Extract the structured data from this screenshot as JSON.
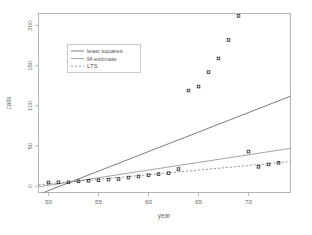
{
  "chart_data": {
    "type": "scatter",
    "title": "",
    "xlabel": "year",
    "ylabel": "calls",
    "xlim": [
      49.0,
      74.2
    ],
    "ylim": [
      -8,
      215
    ],
    "xticks": [
      50,
      55,
      60,
      65,
      70
    ],
    "yticks": [
      0,
      50,
      100,
      150,
      200
    ],
    "grid": false,
    "legend_position": "upper-left",
    "points": {
      "name": "phones",
      "x": [
        50,
        51,
        52,
        53,
        54,
        55,
        56,
        57,
        58,
        59,
        60,
        61,
        62,
        63,
        64,
        65,
        66,
        67,
        68,
        69,
        70,
        71,
        72,
        73
      ],
      "y": [
        4.4,
        4.7,
        4.7,
        5.9,
        6.6,
        7.3,
        8.1,
        8.8,
        10.6,
        12.0,
        13.5,
        14.9,
        16.1,
        21.2,
        119.0,
        124.0,
        142.0,
        159.0,
        182.0,
        212.0,
        43.0,
        24.0,
        27.0,
        29.0
      ]
    },
    "series": [
      {
        "name": "least squares",
        "type": "line",
        "style": "solid",
        "color": "#6e6e6e",
        "x": [
          49.0,
          74.2
        ],
        "y": [
          -10.5,
          112.0
        ],
        "slope": 5.04,
        "intercept": -260.1
      },
      {
        "name": "M-estimate",
        "type": "line",
        "style": "solid",
        "color": "#9a9a9a",
        "x": [
          49.0,
          74.2
        ],
        "y": [
          -1.0,
          47.0
        ],
        "slope": 1.91,
        "intercept": -94.5
      },
      {
        "name": "LTS",
        "type": "line",
        "style": "dashed",
        "color": "#8f8f8f",
        "x": [
          49.0,
          74.2
        ],
        "y": [
          1.5,
          30.5
        ],
        "slope": 1.15,
        "intercept": -54.9
      }
    ],
    "legend": [
      {
        "label": "least squares",
        "style": "solid",
        "color": "#6e6e6e"
      },
      {
        "label": "M-estimate",
        "style": "solid",
        "color": "#9a9a9a"
      },
      {
        "label": "LTS",
        "style": "dashed",
        "color": "#8f8f8f"
      }
    ]
  },
  "axis": {
    "x_tick_labels": [
      "50",
      "55",
      "60",
      "65",
      "70"
    ],
    "y_tick_labels": [
      "0",
      "50",
      "100",
      "150",
      "200"
    ],
    "xlabel": "year",
    "ylabel": "calls"
  },
  "colors": {
    "frame": "#b5b5b5",
    "point": "#3a3a3a",
    "background": "#ffffff"
  }
}
